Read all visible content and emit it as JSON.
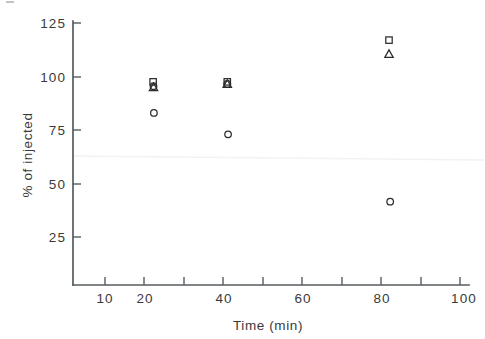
{
  "chart_data": {
    "type": "scatter",
    "title": "",
    "xlabel": "Time (min)",
    "ylabel": "% of injected",
    "xlim": [
      0,
      103
    ],
    "ylim": [
      0,
      127
    ],
    "grid": false,
    "legend": "none",
    "xticks": [
      10,
      20,
      30,
      40,
      50,
      60,
      70,
      80,
      90,
      100
    ],
    "xtick_labels": [
      "10",
      "20",
      "",
      "40",
      "",
      "60",
      "",
      "80",
      "",
      "100"
    ],
    "yticks": [
      25,
      50,
      75,
      100,
      125
    ],
    "ytick_labels": [
      "25",
      "50",
      "75",
      "100",
      "125"
    ],
    "series": [
      {
        "name": "square",
        "marker": "square",
        "points": [
          {
            "x": 22.2,
            "y": 97.5
          },
          {
            "x": 41.0,
            "y": 97.5
          },
          {
            "x": 82.0,
            "y": 117.0
          }
        ]
      },
      {
        "name": "triangle",
        "marker": "triangle",
        "points": [
          {
            "x": 22.3,
            "y": 95.0
          },
          {
            "x": 41.0,
            "y": 96.5
          },
          {
            "x": 82.0,
            "y": 110.5
          }
        ]
      },
      {
        "name": "circle",
        "marker": "circle",
        "points": [
          {
            "x": 22.3,
            "y": 95.5
          },
          {
            "x": 22.4,
            "y": 83.0
          },
          {
            "x": 41.0,
            "y": 96.5
          },
          {
            "x": 41.2,
            "y": 73.0
          },
          {
            "x": 82.3,
            "y": 41.5
          }
        ]
      }
    ]
  },
  "axis_titles": {
    "x": "Time (min)",
    "y": "% of injected"
  },
  "colors": {
    "axis": "#555c5f",
    "text": "#3a3a3a",
    "marker": "#2b2b2b",
    "background": "#ffffff"
  }
}
